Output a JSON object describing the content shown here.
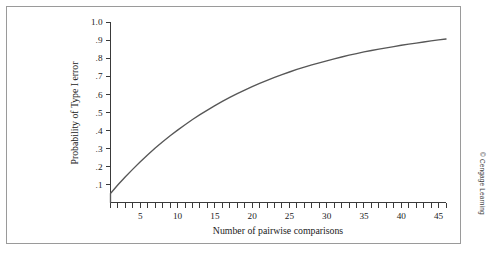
{
  "figure": {
    "credit": "© Cengage Learning",
    "frame_color": "#9a9a9a",
    "background": "#ffffff"
  },
  "chart_data": {
    "type": "line",
    "title": "",
    "subtitle": "",
    "xlabel": "Number of pairwise comparisons",
    "ylabel": "Probability of Type I error",
    "xlim": [
      1,
      46
    ],
    "ylim": [
      0,
      1.0
    ],
    "grid": false,
    "legend": null,
    "line_color": "#575757",
    "formula": "1 - (1 - .05)^c",
    "alpha": 0.05,
    "x_ticklabels": [
      "5",
      "10",
      "15",
      "20",
      "25",
      "30",
      "35",
      "40",
      "45"
    ],
    "x_tickvalues": [
      5,
      10,
      15,
      20,
      25,
      30,
      35,
      40,
      45
    ],
    "x_minor_tick_step": 1,
    "y_ticklabels": [
      "1.0",
      ".9",
      ".8",
      ".7",
      ".6",
      ".5",
      ".4",
      ".3",
      ".2",
      ".1"
    ],
    "y_tickvalues": [
      1.0,
      0.9,
      0.8,
      0.7,
      0.6,
      0.5,
      0.4,
      0.3,
      0.2,
      0.1
    ],
    "x": [
      1,
      2,
      3,
      4,
      5,
      6,
      7,
      8,
      9,
      10,
      11,
      12,
      13,
      14,
      15,
      16,
      17,
      18,
      19,
      20,
      21,
      22,
      23,
      24,
      25,
      26,
      27,
      28,
      29,
      30,
      31,
      32,
      33,
      34,
      35,
      36,
      37,
      38,
      39,
      40,
      41,
      42,
      43,
      44,
      45,
      46
    ],
    "values": [
      0.05,
      0.098,
      0.143,
      0.185,
      0.226,
      0.265,
      0.302,
      0.337,
      0.37,
      0.401,
      0.431,
      0.46,
      0.487,
      0.512,
      0.537,
      0.56,
      0.582,
      0.603,
      0.623,
      0.642,
      0.66,
      0.677,
      0.693,
      0.708,
      0.723,
      0.737,
      0.75,
      0.762,
      0.774,
      0.785,
      0.796,
      0.806,
      0.816,
      0.825,
      0.834,
      0.842,
      0.85,
      0.857,
      0.864,
      0.871,
      0.877,
      0.883,
      0.889,
      0.895,
      0.901,
      0.906
    ]
  }
}
